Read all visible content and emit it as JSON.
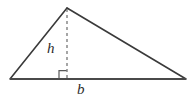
{
  "figure": {
    "name": "triangle-area-diagram",
    "background_color": "#ffffff",
    "stroke_color": "#3a3a3a",
    "base_stroke_color": "#4a4a4a",
    "dash_color": "#6b6b6b",
    "label_color": "#2b2b2b",
    "labels": {
      "height": "h",
      "base": "b"
    },
    "geometry": {
      "apex": [
        67,
        8
      ],
      "left_vertex": [
        10,
        79
      ],
      "right_vertex": [
        186,
        79
      ],
      "foot_of_altitude": [
        67,
        79
      ],
      "right_angle_marker_size": 8,
      "dash_pattern": "3 3",
      "side_stroke_width": 1.6,
      "base_stroke_width": 2.2,
      "dash_stroke_width": 1.2
    }
  }
}
